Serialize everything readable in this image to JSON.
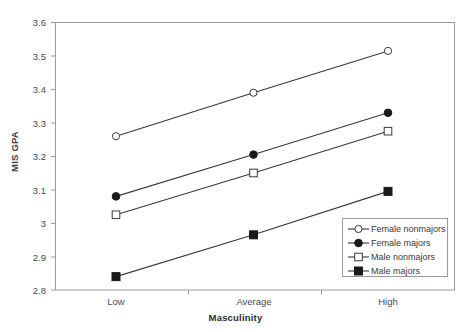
{
  "chart_data": {
    "type": "line",
    "title": "",
    "xlabel": "Masculinity",
    "ylabel": "MIS GPA",
    "categories": [
      "Low",
      "Average",
      "High"
    ],
    "ylim": [
      2.8,
      3.6
    ],
    "yticks": [
      "3.6",
      "3.5",
      "3.4",
      "3.3",
      "3.2",
      "3.1",
      "3",
      "2.9",
      "2.8"
    ],
    "ytick_values": [
      3.6,
      3.5,
      3.4,
      3.3,
      3.2,
      3.1,
      3.0,
      2.9,
      2.8
    ],
    "grid": false,
    "legend_position": "lower-right-inside",
    "series": [
      {
        "name": "Female nonmajors",
        "marker": "open-circle",
        "values": [
          3.26,
          3.39,
          3.515
        ]
      },
      {
        "name": "Female majors",
        "marker": "filled-circle",
        "values": [
          3.08,
          3.205,
          3.33
        ]
      },
      {
        "name": "Male nonmajors",
        "marker": "open-square",
        "values": [
          3.025,
          3.15,
          3.275
        ]
      },
      {
        "name": "Male majors",
        "marker": "filled-square",
        "values": [
          2.84,
          2.965,
          3.095
        ]
      }
    ],
    "colors": {
      "line": "#3a3a3a",
      "axis": "#9a9a9a",
      "text": "#3a3a3a",
      "background": "#ffffff"
    }
  }
}
